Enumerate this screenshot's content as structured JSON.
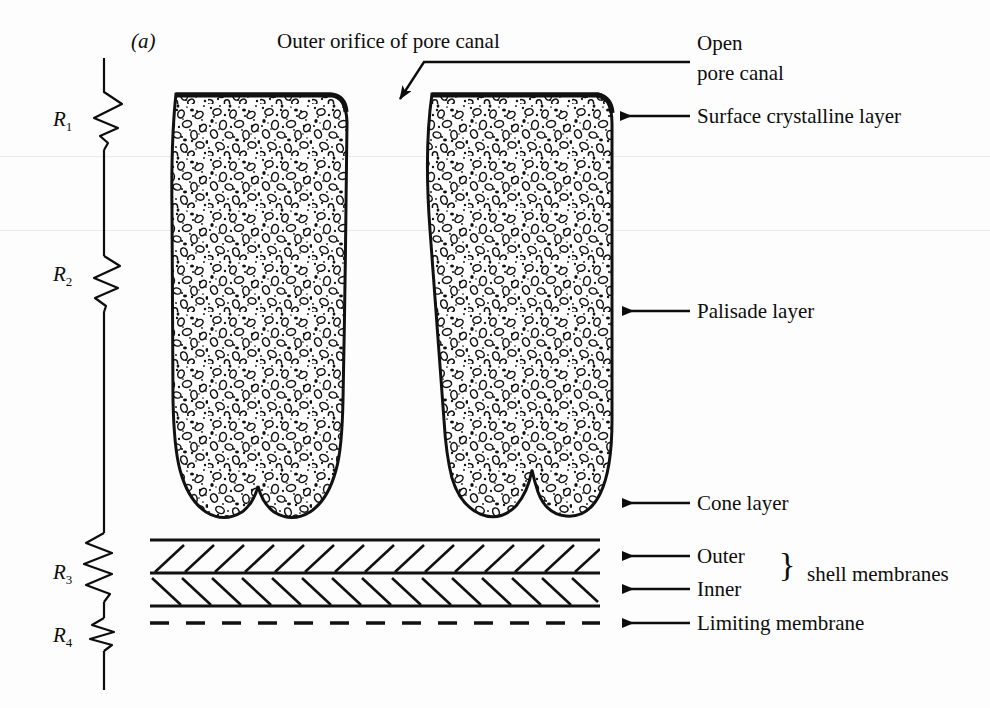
{
  "figure": {
    "panel_letter": "(a)",
    "title": "Outer orifice of pore canal",
    "background_color": "#fdfdfd",
    "ink_color": "#0d0d0d",
    "width": 990,
    "height": 708
  },
  "left_axis": {
    "kind": "resistor-ladder",
    "description": "vertical line with four zigzag resistor symbols",
    "regions": [
      {
        "id": "R1",
        "label": "R",
        "subscript": "1",
        "label_y": 120
      },
      {
        "id": "R2",
        "label": "R",
        "subscript": "2",
        "label_y": 275
      },
      {
        "id": "R3",
        "label": "R",
        "subscript": "3",
        "label_y": 573
      },
      {
        "id": "R4",
        "label": "R",
        "subscript": "4",
        "label_y": 636
      }
    ]
  },
  "callouts": [
    {
      "id": "open-pore-canal",
      "line1": "Open",
      "line2": "pore canal",
      "text": "Open pore canal",
      "leader": "elbow-arrow-down-left",
      "x": 697,
      "y_line1": 43,
      "y_line2": 73
    },
    {
      "id": "surface-crystalline-layer",
      "text": "Surface crystalline layer",
      "leader": "arrow-left",
      "x": 697,
      "y": 116
    },
    {
      "id": "palisade-layer",
      "text": "Palisade layer",
      "leader": "arrow-left",
      "x": 697,
      "y": 311
    },
    {
      "id": "cone-layer",
      "text": "Cone layer",
      "leader": "arrow-left",
      "x": 697,
      "y": 503
    },
    {
      "id": "outer-shell-membrane",
      "text": "Outer",
      "leader": "arrow-left",
      "x": 697,
      "y": 556
    },
    {
      "id": "inner-shell-membrane",
      "text": "Inner",
      "leader": "arrow-left",
      "x": 697,
      "y": 589
    },
    {
      "id": "shell-membranes-group",
      "text": "shell membranes",
      "brace": "}",
      "x": 800,
      "y": 573
    },
    {
      "id": "limiting-membrane",
      "text": "Limiting membrane",
      "leader": "arrow-left",
      "x": 697,
      "y": 623
    }
  ],
  "structure": {
    "columns": [
      {
        "id": "left-palisade-column",
        "x_left": 172,
        "x_right": 345,
        "y_top": 93,
        "y_bottom": 522
      },
      {
        "id": "right-palisade-column",
        "x_left": 423,
        "x_right": 612,
        "y_top": 93,
        "y_bottom": 522
      }
    ],
    "membrane_lines": [
      {
        "id": "line-above-outer",
        "y": 540,
        "style": "solid"
      },
      {
        "id": "line-between-outer-inner",
        "y": 573,
        "style": "solid"
      },
      {
        "id": "line-below-inner",
        "y": 606,
        "style": "solid"
      },
      {
        "id": "limiting-membrane-line",
        "y": 623,
        "style": "dashed"
      }
    ],
    "hatch_bands": [
      {
        "id": "outer-membrane-hatch",
        "y_top": 540,
        "y_bottom": 573,
        "direction": "forward-slash"
      },
      {
        "id": "inner-membrane-hatch",
        "y_top": 573,
        "y_bottom": 606,
        "direction": "back-slash"
      }
    ],
    "membrane_x_left": 150,
    "membrane_x_right": 600
  }
}
